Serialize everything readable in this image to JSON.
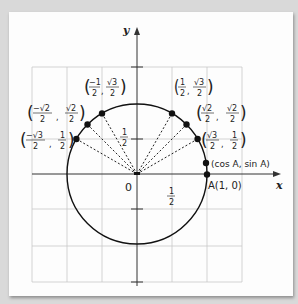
{
  "diagram": {
    "axes": {
      "x_label": "x",
      "y_label": "y",
      "origin_label": "0"
    },
    "tick_labels": {
      "x_half": {
        "num": "1",
        "den": "2"
      },
      "y_half": {
        "num": "1",
        "den": "2"
      }
    },
    "points": [
      {
        "id": "p30",
        "num_x": "√3",
        "den_x": "2",
        "num_y": "1",
        "den_y": "2",
        "sign_x": ""
      },
      {
        "id": "p45",
        "num_x": "√2",
        "den_x": "2",
        "num_y": "√2",
        "den_y": "2",
        "sign_x": ""
      },
      {
        "id": "p60",
        "num_x": "1",
        "den_x": "2",
        "num_y": "√3",
        "den_y": "2",
        "sign_x": ""
      },
      {
        "id": "p120",
        "num_x": "1",
        "den_x": "2",
        "num_y": "√3",
        "den_y": "2",
        "sign_x": "−"
      },
      {
        "id": "p135",
        "num_x": "√2",
        "den_x": "2",
        "num_y": "√2",
        "den_y": "2",
        "sign_x": "−"
      },
      {
        "id": "p150",
        "num_x": "√3",
        "den_x": "2",
        "num_y": "1",
        "den_y": "2",
        "sign_x": "−"
      }
    ],
    "general_point_label": "(cos A, sin A)",
    "point_a_label": "A(1, 0)",
    "colors": {
      "line": "#111111",
      "grid": "#c8c8c8",
      "background": "#fdfdfd",
      "page": "#d9d9d9"
    }
  }
}
